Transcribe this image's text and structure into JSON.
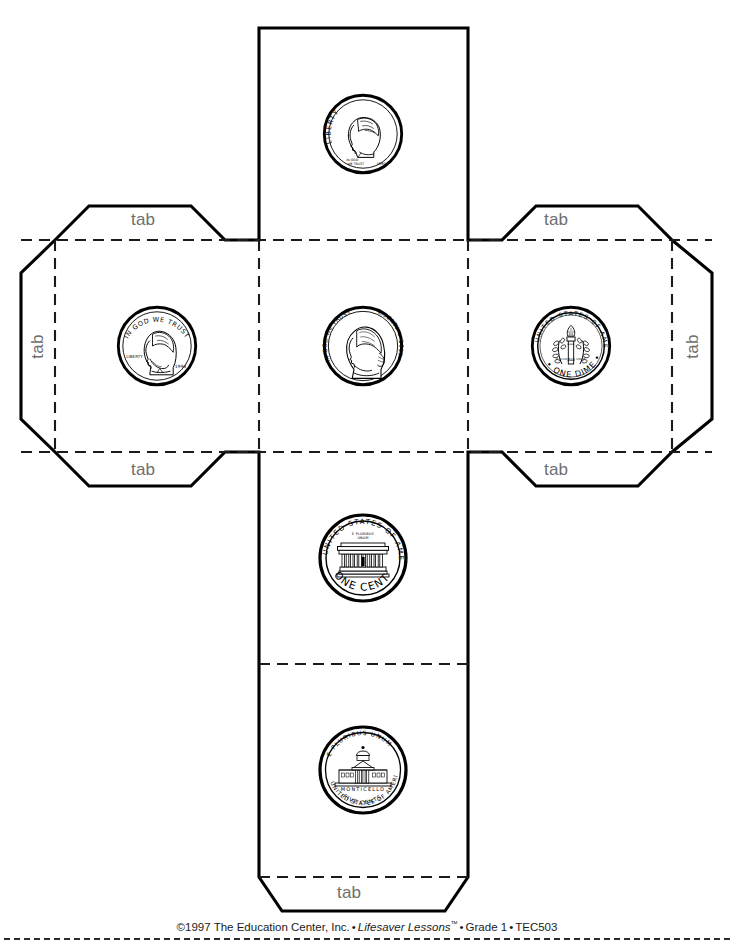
{
  "document": {
    "title": "Coin Cube Pattern",
    "kind": "cut-and-fold cube net",
    "face_size_px": 212,
    "colors": {
      "cut_line": "#000000",
      "fold_line": "#1a1a1a",
      "tab_text": "#6e6e6e",
      "footer_text": "#1a1a1a",
      "background": "#ffffff"
    }
  },
  "tabs": [
    {
      "id": "tab-left-face-top",
      "label": "tab",
      "orientation": "horizontal",
      "x": 158,
      "y": 219
    },
    {
      "id": "tab-left-face-left",
      "label": "tab",
      "orientation": "vertical",
      "x": 37,
      "y": 346
    },
    {
      "id": "tab-left-face-bottom",
      "label": "tab",
      "orientation": "horizontal",
      "x": 158,
      "y": 469
    },
    {
      "id": "tab-right-face-top",
      "label": "tab",
      "orientation": "horizontal",
      "x": 570,
      "y": 219
    },
    {
      "id": "tab-right-face-right",
      "label": "tab",
      "orientation": "vertical",
      "x": 692,
      "y": 346
    },
    {
      "id": "tab-right-face-bottom",
      "label": "tab",
      "orientation": "horizontal",
      "x": 570,
      "y": 469
    },
    {
      "id": "tab-bottom-face",
      "label": "tab",
      "orientation": "horizontal",
      "x": 363,
      "y": 892
    }
  ],
  "faces": [
    {
      "id": "face-top",
      "position": "top",
      "coin": "dime-obverse",
      "coin_name": "Dime (heads)",
      "inscriptions": [
        "LIBERTY",
        "IN GOD WE TRUST",
        "1990"
      ],
      "center": {
        "x": 363,
        "y": 134
      }
    },
    {
      "id": "face-left",
      "position": "middle-left",
      "coin": "penny-obverse",
      "coin_name": "Penny (heads)",
      "inscriptions": [
        "IN GOD WE TRUST",
        "LIBERTY",
        "1994"
      ],
      "center": {
        "x": 157,
        "y": 346
      }
    },
    {
      "id": "face-center",
      "position": "middle-center",
      "coin": "nickel-obverse",
      "coin_name": "Nickel (heads)",
      "inscriptions": [
        "IN GOD WE TRUST",
        "LIBERTY",
        "1997"
      ],
      "center": {
        "x": 363,
        "y": 346
      }
    },
    {
      "id": "face-right",
      "position": "middle-right",
      "coin": "dime-reverse",
      "coin_name": "Dime (tails)",
      "inscriptions": [
        "UNITED STATES OF AMERICA",
        "E PLURIBUS UNUM",
        "ONE DIME"
      ],
      "center": {
        "x": 571,
        "y": 346
      }
    },
    {
      "id": "face-lower",
      "position": "lower-center",
      "coin": "penny-reverse",
      "coin_name": "Penny (tails)",
      "inscriptions": [
        "UNITED STATES OF AMERICA",
        "E PLURIBUS UNUM",
        "ONE CENT"
      ],
      "center": {
        "x": 363,
        "y": 558
      }
    },
    {
      "id": "face-bottom",
      "position": "bottom-center",
      "coin": "nickel-reverse",
      "coin_name": "Nickel (tails)",
      "inscriptions": [
        "E PLURIBUS UNUM",
        "MONTICELLO",
        "FIVE CENTS",
        "UNITED STATES OF AMERICA"
      ],
      "center": {
        "x": 363,
        "y": 770
      }
    }
  ],
  "footer": {
    "copyright": "©1997 The Education Center, Inc.",
    "sep1": "•",
    "series": "Lifesaver Lessons",
    "tm": "™",
    "sep2": "•",
    "grade": "Grade 1",
    "sep3": "•",
    "code": "TEC503"
  }
}
